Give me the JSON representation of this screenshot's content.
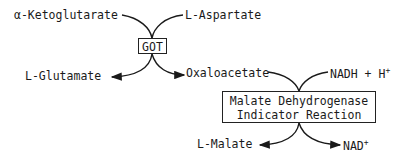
{
  "diagram": {
    "type": "coupled-enzyme-reaction",
    "reaction1": {
      "enzyme": "GOT",
      "substrates": [
        "α-Ketoglutarate",
        "L-Aspartate"
      ],
      "products": [
        "L-Glutamate",
        "Oxaloacetate"
      ]
    },
    "reaction2": {
      "enzyme_line1": "Malate Dehydrogenase",
      "enzyme_line2": "Indicator Reaction",
      "substrates": [
        "Oxaloacetate",
        "NADH + H"
      ],
      "products": [
        "L-Malate",
        "NAD"
      ]
    },
    "labels": {
      "alpha_ketoglutarate": "α-Ketoglutarate",
      "l_aspartate": "L-Aspartate",
      "got": "GOT",
      "l_glutamate": "L-Glutamate",
      "oxaloacetate": "Oxaloacetate",
      "nadh_h": "NADH + H",
      "nadh_h_sup": "+",
      "mdh_line1": "Malate Dehydrogenase",
      "mdh_line2": "Indicator Reaction",
      "l_malate": "L-Malate",
      "nad": "NAD",
      "nad_sup": "+"
    }
  }
}
